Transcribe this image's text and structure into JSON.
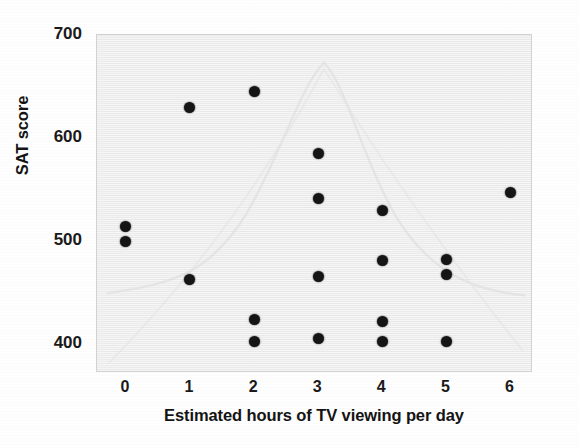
{
  "chart_data": {
    "type": "scatter",
    "title": "",
    "xlabel": "Estimated hours of TV viewing per day",
    "ylabel": "SAT score",
    "xlim": [
      -0.45,
      6.35
    ],
    "ylim": [
      372,
      700
    ],
    "xticks": [
      0,
      1,
      2,
      3,
      4,
      5,
      6
    ],
    "xtick_labels": [
      "0",
      "1",
      "2",
      "3",
      "4",
      "5",
      "6"
    ],
    "yticks": [
      400,
      500,
      600,
      700
    ],
    "ytick_labels": [
      "400",
      "500",
      "600",
      "700"
    ],
    "grid": false,
    "legend": null,
    "marker": {
      "shape": "circle",
      "color": "#151515",
      "size_px": 11
    },
    "plot_background": "#ebebeb",
    "points": [
      {
        "x": 0,
        "y": 514
      },
      {
        "x": 0,
        "y": 500
      },
      {
        "x": 1,
        "y": 630
      },
      {
        "x": 1,
        "y": 463
      },
      {
        "x": 2,
        "y": 645
      },
      {
        "x": 2,
        "y": 424
      },
      {
        "x": 2,
        "y": 403
      },
      {
        "x": 3,
        "y": 585
      },
      {
        "x": 3,
        "y": 541
      },
      {
        "x": 3,
        "y": 466
      },
      {
        "x": 3,
        "y": 405
      },
      {
        "x": 4,
        "y": 530
      },
      {
        "x": 4,
        "y": 481
      },
      {
        "x": 4,
        "y": 422
      },
      {
        "x": 4,
        "y": 403
      },
      {
        "x": 5,
        "y": 482
      },
      {
        "x": 5,
        "y": 468
      },
      {
        "x": 5,
        "y": 403
      },
      {
        "x": 6,
        "y": 547
      }
    ]
  }
}
